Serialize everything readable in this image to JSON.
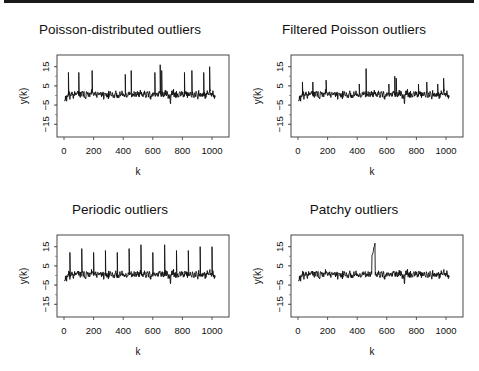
{
  "chart_data": [
    {
      "type": "line",
      "title": "Poisson-distributed outliers",
      "xlabel": "k",
      "ylabel": "y(k)",
      "xlim": [
        0,
        1024
      ],
      "ylim": [
        -19,
        19
      ],
      "xticks": [
        0,
        200,
        400,
        600,
        800,
        1000
      ],
      "yticks": [
        15,
        5,
        -5,
        -15
      ],
      "baseline_noise": {
        "mean": 0,
        "amplitude": 2.5,
        "seed": 11
      },
      "spikes": [
        {
          "k": 30,
          "y": 12
        },
        {
          "k": 100,
          "y": 12
        },
        {
          "k": 190,
          "y": 13
        },
        {
          "k": 415,
          "y": 11
        },
        {
          "k": 455,
          "y": 13
        },
        {
          "k": 615,
          "y": 12
        },
        {
          "k": 650,
          "y": 16
        },
        {
          "k": 660,
          "y": 13
        },
        {
          "k": 815,
          "y": 12
        },
        {
          "k": 865,
          "y": 13
        },
        {
          "k": 945,
          "y": 12
        },
        {
          "k": 985,
          "y": 15
        }
      ],
      "dips": [
        {
          "k": 720,
          "y": -6
        }
      ]
    },
    {
      "type": "line",
      "title": "Filtered Poisson outliers",
      "xlabel": "k",
      "ylabel": "y(k)",
      "xlim": [
        0,
        1024
      ],
      "ylim": [
        -19,
        19
      ],
      "xticks": [
        0,
        200,
        400,
        600,
        800,
        1000
      ],
      "yticks": [
        15,
        5,
        -5,
        -15
      ],
      "baseline_noise": {
        "mean": 0,
        "amplitude": 2.5,
        "seed": 11
      },
      "spikes": [
        {
          "k": 30,
          "y": 7
        },
        {
          "k": 100,
          "y": 7
        },
        {
          "k": 190,
          "y": 8
        },
        {
          "k": 415,
          "y": 6
        },
        {
          "k": 460,
          "y": 14
        },
        {
          "k": 615,
          "y": 6
        },
        {
          "k": 655,
          "y": 10
        },
        {
          "k": 665,
          "y": 9
        },
        {
          "k": 815,
          "y": 6
        },
        {
          "k": 870,
          "y": 7
        },
        {
          "k": 945,
          "y": 6
        },
        {
          "k": 985,
          "y": 9
        }
      ],
      "dips": [
        {
          "k": 720,
          "y": -6
        }
      ]
    },
    {
      "type": "line",
      "title": "Periodic outliers",
      "xlabel": "k",
      "ylabel": "y(k)",
      "xlim": [
        0,
        1024
      ],
      "ylim": [
        -19,
        19
      ],
      "xticks": [
        0,
        200,
        400,
        600,
        800,
        1000
      ],
      "yticks": [
        15,
        5,
        -5,
        -15
      ],
      "baseline_noise": {
        "mean": 0,
        "amplitude": 2.5,
        "seed": 11
      },
      "spikes": [
        {
          "k": 40,
          "y": 12
        },
        {
          "k": 120,
          "y": 14
        },
        {
          "k": 200,
          "y": 12
        },
        {
          "k": 280,
          "y": 13
        },
        {
          "k": 360,
          "y": 12
        },
        {
          "k": 440,
          "y": 14
        },
        {
          "k": 520,
          "y": 16
        },
        {
          "k": 600,
          "y": 12
        },
        {
          "k": 680,
          "y": 16
        },
        {
          "k": 760,
          "y": 13
        },
        {
          "k": 840,
          "y": 13
        },
        {
          "k": 920,
          "y": 15
        },
        {
          "k": 1000,
          "y": 15
        }
      ],
      "dips": [
        {
          "k": 720,
          "y": -6
        }
      ]
    },
    {
      "type": "line",
      "title": "Patchy outliers",
      "xlabel": "k",
      "ylabel": "y(k)",
      "xlim": [
        0,
        1024
      ],
      "ylim": [
        -19,
        19
      ],
      "xticks": [
        0,
        200,
        400,
        600,
        800,
        1000
      ],
      "yticks": [
        15,
        5,
        -5,
        -15
      ],
      "baseline_noise": {
        "mean": 0,
        "amplitude": 2.5,
        "seed": 11
      },
      "patch": {
        "k_start": 500,
        "k_end": 520,
        "y_min": 10,
        "y_max": 17
      },
      "spikes": [],
      "dips": [
        {
          "k": 720,
          "y": -6
        }
      ]
    }
  ]
}
